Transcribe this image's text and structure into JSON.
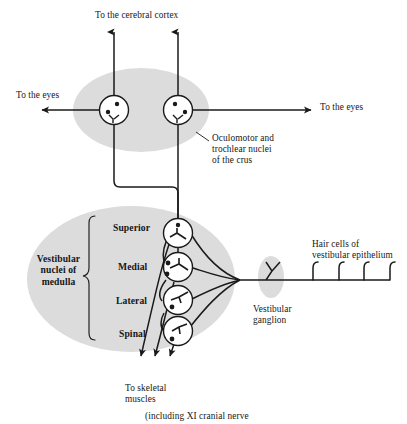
{
  "figure": {
    "title_caption": "(including XI cranial nerve",
    "labels": {
      "to_cerebral_cortex": "To the cerebral cortex",
      "to_the_eyes_left": "To the eyes",
      "to_the_eyes_right": "To the eyes",
      "oculomotor_nuclei": "Oculomotor and\ntrochlear nuclei\nof the crus",
      "vestibular_nuclei_medulla": "Vestibular\nnuclei of\nmedulla",
      "hair_cells": "Hair cells of\nvestibular epithelium",
      "vestibular_ganglion": "Vestibular\nganglion",
      "to_skeletal_muscles": "To skeletal\nmuscles"
    },
    "nuclei_list": [
      {
        "name": "Superior"
      },
      {
        "name": "Medial"
      },
      {
        "name": "Lateral"
      },
      {
        "name": "Spinal"
      }
    ],
    "colors": {
      "ellipse_fill": "#dcdcdc",
      "ganglion_fill": "#dcdcdc",
      "stroke": "#1a1a1a",
      "background": "#ffffff",
      "text": "#161616"
    },
    "counts": {
      "crus_neurons": 2,
      "vestibular_neurons": 4,
      "hair_cells": 4,
      "cortex_arrows": 2,
      "eye_arrows": 2,
      "skeletal_arrows": 3
    }
  }
}
